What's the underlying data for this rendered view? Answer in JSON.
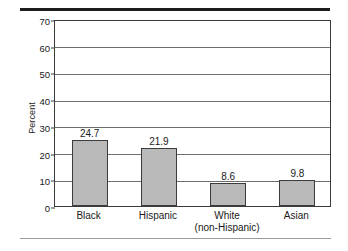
{
  "chart_data": {
    "type": "bar",
    "title": "",
    "subtitle": "",
    "xlabel": "",
    "ylabel": "Percent",
    "categories": [
      "Black",
      "Hispanic",
      "White\n(non-Hispanic)",
      "Asian"
    ],
    "category_lines": [
      [
        "Black"
      ],
      [
        "Hispanic"
      ],
      [
        "White",
        "(non-Hispanic)"
      ],
      [
        "Asian"
      ]
    ],
    "values": [
      24.7,
      21.9,
      8.6,
      9.8
    ],
    "value_labels": [
      "24.7",
      "21.9",
      "8.6",
      "9.8"
    ],
    "ylim": [
      0,
      70
    ],
    "yticks": [
      0,
      10,
      20,
      30,
      40,
      50,
      60,
      70
    ],
    "ytick_labels": [
      "0",
      "10",
      "20",
      "30",
      "40",
      "50",
      "60",
      "70"
    ],
    "grid": "horizontal",
    "legend": "none",
    "bar_fill_color": "#b9b9b9",
    "bar_edge_color": "#3c3c3c",
    "gridline_color": "#6e6e6e",
    "axis_color": "#3a3a3a",
    "rule_color_top": "#1c1c1c",
    "rule_color_bottom": "#9a9a9a"
  }
}
